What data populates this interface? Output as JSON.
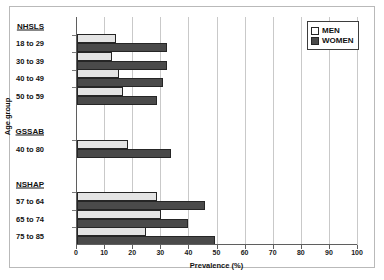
{
  "chart_data": {
    "type": "bar",
    "orientation": "horizontal",
    "title": "",
    "xlabel": "Prevalence (%)",
    "ylabel": "Age group",
    "xlim": [
      0,
      100
    ],
    "xticks": [
      0,
      10,
      20,
      30,
      40,
      50,
      60,
      70,
      80,
      90,
      100
    ],
    "grid": true,
    "legend_position": "top-right",
    "legend": [
      "MEN",
      "WOMEN"
    ],
    "series": [
      {
        "name": "MEN",
        "color": "#e4e4e4",
        "values": [
          14,
          12.5,
          15,
          16.5,
          18,
          28.5,
          30,
          24.5
        ]
      },
      {
        "name": "WOMEN",
        "color": "#4a4a4a",
        "values": [
          32,
          32,
          30.5,
          28.5,
          33.5,
          45.5,
          39.5,
          49
        ]
      }
    ],
    "categories": [
      "18 to 29",
      "30 to 39",
      "40 to 49",
      "50 to 59",
      "40 to 80",
      "57 to 64",
      "65 to 74",
      "75 to 85"
    ],
    "groups": [
      {
        "name": "NHSLS",
        "categories": [
          "18 to 29",
          "30 to 39",
          "40 to 49",
          "50 to 59"
        ]
      },
      {
        "name": "GSSAB",
        "categories": [
          "40 to 80"
        ]
      },
      {
        "name": "NSHAP",
        "categories": [
          "57 to 64",
          "65 to 74",
          "75 to 85"
        ]
      }
    ]
  }
}
